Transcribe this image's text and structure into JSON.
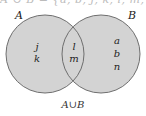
{
  "title_fragment": "A ∪ B = {a, b, j, k, l, m, n}",
  "sets": {
    "A": {
      "label": "A",
      "only_elements": [
        "j",
        "k"
      ]
    },
    "B": {
      "label": "B",
      "only_elements": [
        "a",
        "b",
        "n"
      ]
    },
    "intersection": {
      "elements": [
        "l",
        "m"
      ]
    }
  },
  "caption": "A∪B",
  "colors": {
    "fill": "#d3d3d3",
    "stroke": "#6e6e6e",
    "text": "#222222"
  }
}
